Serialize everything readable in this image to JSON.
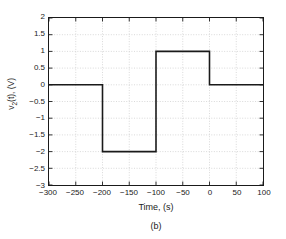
{
  "figure": {
    "caption": "(b)",
    "background_color": "#ffffff",
    "axis_color": "#1a1a1a",
    "grid_color": "#c8c8c8",
    "series_color": "#1a1a1a"
  },
  "chart_data": {
    "type": "line",
    "title": "",
    "subtitle": "",
    "xlabel": "Time, (s)",
    "ylabel": "v₂(t), (V)",
    "ylabel_parts": {
      "base": "v",
      "sub": "2",
      "rest": "(t), (V)"
    },
    "xlim": [
      -300,
      100
    ],
    "ylim": [
      -3,
      2
    ],
    "xticks": [
      -300,
      -250,
      -200,
      -150,
      -100,
      -50,
      0,
      50,
      100
    ],
    "xtick_labels": [
      "−300",
      "−250",
      "−200",
      "−150",
      "−100",
      "−50",
      "0",
      "50",
      "100"
    ],
    "yticks": [
      2,
      1.5,
      1,
      0.5,
      0,
      -0.5,
      -1,
      -1.5,
      -2,
      -2.5,
      -3
    ],
    "ytick_labels": [
      "2",
      "1.5",
      "1",
      "0.5",
      "0",
      "−0.5",
      "−1",
      "−1.5",
      "−2",
      "−2.5",
      "−3"
    ],
    "grid": true,
    "grid_style": "dotted",
    "legend": null,
    "annotations": [],
    "series": [
      {
        "name": "v2(t)",
        "type": "step",
        "color": "#1a1a1a",
        "linewidth": 1.6,
        "x": [
          -300,
          -200,
          -200,
          -100,
          -100,
          0,
          0,
          100
        ],
        "y": [
          0,
          0,
          -2,
          -2,
          1,
          1,
          0,
          0
        ],
        "segments": [
          {
            "from_t": -300,
            "to_t": -200,
            "value": 0
          },
          {
            "from_t": -200,
            "to_t": -100,
            "value": -2
          },
          {
            "from_t": -100,
            "to_t": 0,
            "value": 1
          },
          {
            "from_t": 0,
            "to_t": 100,
            "value": 0
          }
        ]
      }
    ]
  }
}
